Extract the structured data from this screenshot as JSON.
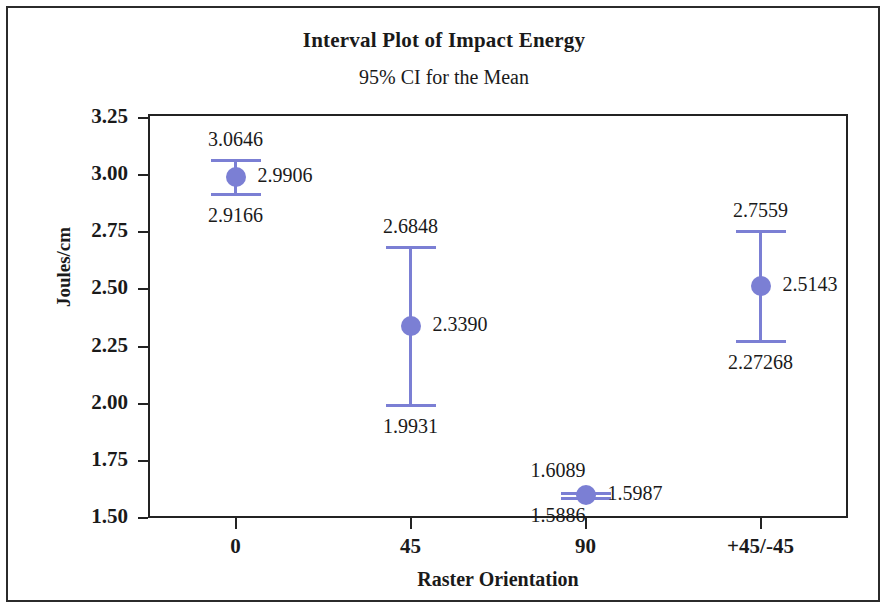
{
  "chart_data": {
    "type": "scatter",
    "title": "Interval Plot of Impact Energy",
    "subtitle": "95% CI for the Mean",
    "xlabel": "Raster Orientation",
    "ylabel": "Joules/cm",
    "categories": [
      "0",
      "45",
      "90",
      "+45/-45"
    ],
    "ylim": [
      1.5,
      3.25
    ],
    "yticks": [
      "3.25",
      "3.00",
      "2.75",
      "2.50",
      "2.25",
      "2.00",
      "1.75",
      "1.50"
    ],
    "ytick_values": [
      3.25,
      3.0,
      2.75,
      2.5,
      2.25,
      2.0,
      1.75,
      1.5
    ],
    "grid": false,
    "legend": "none",
    "series": [
      {
        "name": "Mean with 95% CI",
        "color": "#7b7fd4",
        "points": [
          {
            "category": "0",
            "mean": 2.9906,
            "upper": 3.0646,
            "lower": 2.9166,
            "mean_label": "2.9906",
            "upper_label": "3.0646",
            "lower_label": "2.9166"
          },
          {
            "category": "45",
            "mean": 2.339,
            "upper": 2.6848,
            "lower": 1.9931,
            "mean_label": "2.3390",
            "upper_label": "2.6848",
            "lower_label": "1.9931"
          },
          {
            "category": "90",
            "mean": 1.5987,
            "upper": 1.6089,
            "lower": 1.5886,
            "mean_label": "1.5987",
            "upper_label": "1.6089",
            "lower_label": "1.5886"
          },
          {
            "category": "+45/-45",
            "mean": 2.5143,
            "upper": 2.7559,
            "lower": 2.27268,
            "mean_label": "2.5143",
            "upper_label": "2.7559",
            "lower_label": "2.27268"
          }
        ]
      }
    ]
  },
  "colors": {
    "interval": "#7b7fd4",
    "axis": "#232323",
    "text": "#1a1a1a",
    "background": "#ffffff"
  }
}
